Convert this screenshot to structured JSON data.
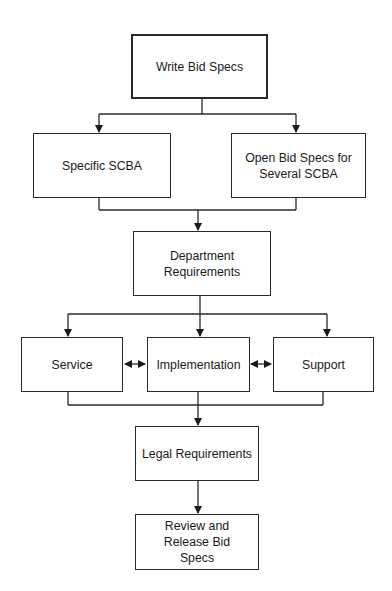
{
  "diagram": {
    "type": "flowchart",
    "nodes": [
      {
        "id": "write",
        "label": "Write Bid Specs"
      },
      {
        "id": "specific",
        "label": "Specific SCBA"
      },
      {
        "id": "open",
        "label": "Open Bid Specs for Several SCBA"
      },
      {
        "id": "dept",
        "label": "Department Requirements"
      },
      {
        "id": "service",
        "label": "Service"
      },
      {
        "id": "impl",
        "label": "Implementation"
      },
      {
        "id": "support",
        "label": "Support"
      },
      {
        "id": "legal",
        "label": "Legal Requirements"
      },
      {
        "id": "review",
        "label": "Review and Release Bid Specs"
      }
    ],
    "edges": [
      {
        "from": "write",
        "to": "specific"
      },
      {
        "from": "write",
        "to": "open"
      },
      {
        "from": "specific",
        "to": "dept"
      },
      {
        "from": "open",
        "to": "dept"
      },
      {
        "from": "dept",
        "to": "service"
      },
      {
        "from": "dept",
        "to": "impl"
      },
      {
        "from": "dept",
        "to": "support"
      },
      {
        "from": "service",
        "to": "impl",
        "bidirectional": true
      },
      {
        "from": "impl",
        "to": "support",
        "bidirectional": true
      },
      {
        "from": "service",
        "to": "legal"
      },
      {
        "from": "impl",
        "to": "legal"
      },
      {
        "from": "support",
        "to": "legal"
      },
      {
        "from": "legal",
        "to": "review"
      }
    ],
    "line_color": "#2a2a2a"
  }
}
